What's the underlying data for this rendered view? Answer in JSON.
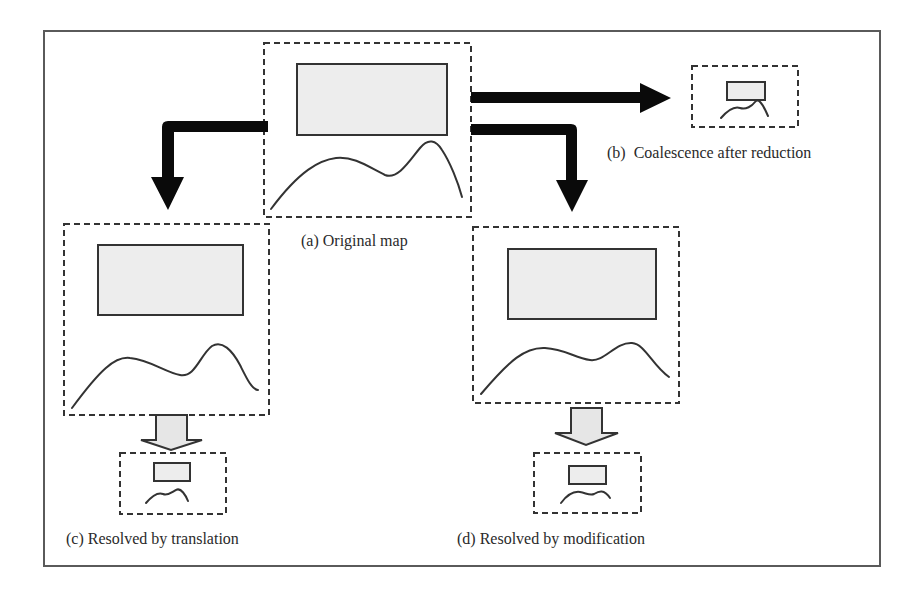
{
  "figure": {
    "frame": {
      "x": 44,
      "y": 31,
      "w": 836,
      "h": 535
    },
    "colors": {
      "frame": "#5a5a5a",
      "dash": "#333333",
      "rect_fill": "#ededed",
      "rect_stroke": "#333333",
      "curve": "#333333",
      "black_arrow": "#0a0a0a",
      "gray_arrow_fill": "#e6e6e6",
      "gray_arrow_stroke": "#333333"
    },
    "panels": [
      {
        "id": "a",
        "label": "(a) Original map",
        "box": {
          "x": 264,
          "y": 43,
          "w": 207,
          "h": 174
        },
        "rect": {
          "x": 297,
          "y": 64,
          "w": 150,
          "h": 71
        },
        "curve": "M271,209 C300,170 320,160 336,158 C355,156 370,168 385,175 C398,180 410,160 420,148 C428,138 436,140 442,150 C450,162 458,182 462,197",
        "label_pos": {
          "x": 301,
          "y": 232
        }
      },
      {
        "id": "b",
        "label": "(b)  Coalescence after reduction",
        "box": {
          "x": 692,
          "y": 66,
          "w": 106,
          "h": 61
        },
        "rect": {
          "x": 727,
          "y": 82,
          "w": 38,
          "h": 18
        },
        "curve": "M721,118 C728,110 734,106 740,108 C746,110 752,106 755,102 C758,98 762,102 768,116",
        "label_pos": {
          "x": 607,
          "y": 144
        }
      },
      {
        "id": "c-before",
        "label": "",
        "box": {
          "x": 64,
          "y": 224,
          "w": 205,
          "h": 191
        },
        "rect": {
          "x": 98,
          "y": 245,
          "w": 145,
          "h": 70
        },
        "curve": "M72,408 C100,370 115,356 130,358 C150,360 165,372 180,375 C195,378 200,355 212,346 C222,340 232,350 240,365 C246,377 252,390 258,390",
        "label_pos": null
      },
      {
        "id": "c",
        "label": "(c) Resolved by translation",
        "box": {
          "x": 120,
          "y": 453,
          "w": 106,
          "h": 61
        },
        "rect": {
          "x": 154,
          "y": 463,
          "w": 36,
          "h": 18
        },
        "curve": "M146,503 C152,496 158,492 163,494 C168,496 172,492 176,490 C181,487 186,496 188,501",
        "label_pos": {
          "x": 66,
          "y": 530
        }
      },
      {
        "id": "d-before",
        "label": "",
        "box": {
          "x": 473,
          "y": 227,
          "w": 206,
          "h": 176
        },
        "rect": {
          "x": 508,
          "y": 249,
          "w": 148,
          "h": 70
        },
        "curve": "M481,394 C510,360 525,347 545,348 C565,349 575,358 590,360 C605,362 615,342 632,343 C645,344 652,365 669,377",
        "label_pos": null
      },
      {
        "id": "d",
        "label": "(d) Resolved by modification",
        "box": {
          "x": 534,
          "y": 453,
          "w": 107,
          "h": 60
        },
        "rect": {
          "x": 569,
          "y": 466,
          "w": 37,
          "h": 18
        },
        "curve": "M561,503 C567,495 573,491 580,492 C586,493 590,496 594,494 C599,491 604,489 610,498",
        "label_pos": {
          "x": 457,
          "y": 530
        }
      }
    ],
    "black_arrows": [
      {
        "name": "arrow-a-to-b",
        "path": "M471,92 L640,92 L640,83 L671,98 L640,113 L640,103 L471,103 Z"
      },
      {
        "name": "arrow-a-to-d",
        "path": "M471,124 L571,124 Q577,124 577,130 L577,180 L588,180 L572,212 L556,180 L566,180 L566,135 L471,135 Z"
      },
      {
        "name": "arrow-a-to-c",
        "path": "M268,121 L168,121 Q162,121 162,127 L162,177 L151,177 L168,210 L184,177 L174,177 L174,132 L268,132 Z"
      }
    ],
    "gray_arrows": [
      {
        "name": "arrow-c-reduce",
        "path": "M156,415 L187,415 L187,440 L202,440 L171,450 L141,440 L156,440 Z"
      },
      {
        "name": "arrow-d-reduce",
        "path": "M571,408 L602,408 L602,433 L618,433 L586,445 L555,433 L571,433 Z"
      }
    ]
  }
}
